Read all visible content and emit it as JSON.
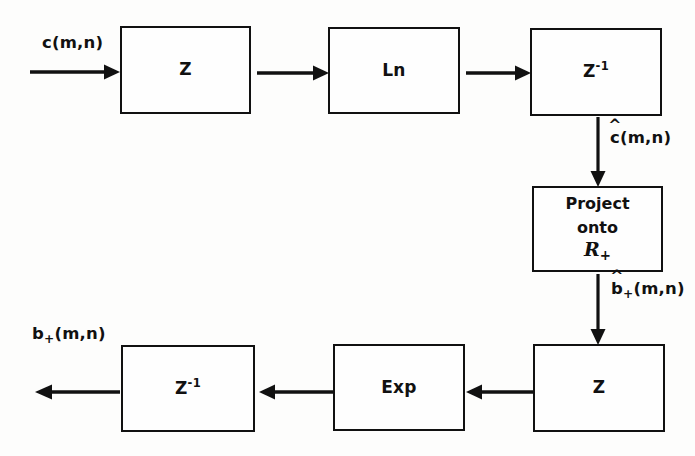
{
  "diagram": {
    "background_color": "#fdfdfc",
    "line_color": "#111111",
    "width": 695,
    "height": 456,
    "blocks": [
      {
        "id": "z-forward-top",
        "label": "Z",
        "main": "Z",
        "exp": "",
        "x": 120,
        "y": 26,
        "w": 131,
        "h": 88
      },
      {
        "id": "ln",
        "label": "Ln",
        "main": "Ln",
        "exp": "",
        "x": 328,
        "y": 27,
        "w": 132,
        "h": 87
      },
      {
        "id": "z-inverse-top",
        "label": "Z-1",
        "main": "Z",
        "exp": "-1",
        "x": 530,
        "y": 28,
        "w": 132,
        "h": 88
      },
      {
        "id": "project",
        "label": "Project onto R+",
        "line1": "Project",
        "line2": "onto",
        "line3": "R",
        "line3_sub": "+",
        "x": 532,
        "y": 186,
        "w": 131,
        "h": 86
      },
      {
        "id": "z-forward-bot",
        "label": "Z",
        "main": "Z",
        "exp": "",
        "x": 533,
        "y": 344,
        "w": 132,
        "h": 88
      },
      {
        "id": "exp",
        "label": "Exp",
        "main": "Exp",
        "exp": "",
        "x": 333,
        "y": 344,
        "w": 132,
        "h": 87
      },
      {
        "id": "z-inverse-bot",
        "label": "Z-1",
        "main": "Z",
        "exp": "-1",
        "x": 121,
        "y": 345,
        "w": 134,
        "h": 87
      }
    ],
    "signals": [
      {
        "id": "input-signal",
        "text": "c(m,n)",
        "base": "c",
        "sub": "",
        "hat": false,
        "args": "(m,n)",
        "x": 42,
        "y": 33
      },
      {
        "id": "cepstrum-signal",
        "text": "ĉ(m,n)",
        "base": "c",
        "sub": "",
        "hat": true,
        "args": "(m,n)",
        "x": 610,
        "y": 128
      },
      {
        "id": "min-phase-signal",
        "text": "b̂+(m,n)",
        "base": "b",
        "sub": "+",
        "hat": true,
        "args": "(m,n)",
        "x": 611,
        "y": 279
      },
      {
        "id": "output-signal",
        "text": "b+(m,n)",
        "base": "b",
        "sub": "+",
        "hat": false,
        "args": "(m,n)",
        "x": 32,
        "y": 324
      }
    ],
    "connectors": [
      {
        "id": "arrow-input",
        "direction": "right",
        "x": 30,
        "y": 71,
        "length": 88
      },
      {
        "id": "arrow-z-to-ln",
        "direction": "right",
        "x": 257,
        "y": 72,
        "length": 70
      },
      {
        "id": "arrow-ln-to-zinv",
        "direction": "right",
        "x": 466,
        "y": 72,
        "length": 63
      },
      {
        "id": "arrow-zinv-to-project",
        "direction": "down",
        "x": 597,
        "y": 117,
        "length": 68
      },
      {
        "id": "arrow-project-to-z",
        "direction": "down",
        "x": 597,
        "y": 274,
        "length": 69
      },
      {
        "id": "arrow-z-to-exp",
        "direction": "left",
        "x": 468,
        "y": 391,
        "length": 64
      },
      {
        "id": "arrow-exp-to-zinv",
        "direction": "left",
        "x": 259,
        "y": 391,
        "length": 70
      },
      {
        "id": "arrow-output",
        "direction": "left",
        "x": 30,
        "y": 391,
        "length": 88
      }
    ]
  }
}
